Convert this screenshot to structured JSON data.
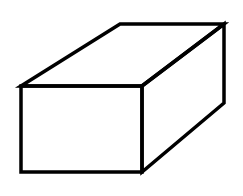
{
  "diagram": {
    "colors": {
      "background": "#ffffff",
      "stroke": "#000000"
    },
    "stroke_width": 3.5,
    "vertices": {
      "front_top_left": [
        21,
        86
      ],
      "front_top_right": [
        142,
        86
      ],
      "front_bottom_right": [
        142,
        172
      ],
      "front_bottom_left": [
        21,
        172
      ],
      "back_top_left": [
        120,
        24
      ],
      "back_top_right": [
        224,
        24
      ],
      "back_bottom_right": [
        224,
        103
      ]
    },
    "faces": [
      "front",
      "top",
      "right-side"
    ]
  }
}
